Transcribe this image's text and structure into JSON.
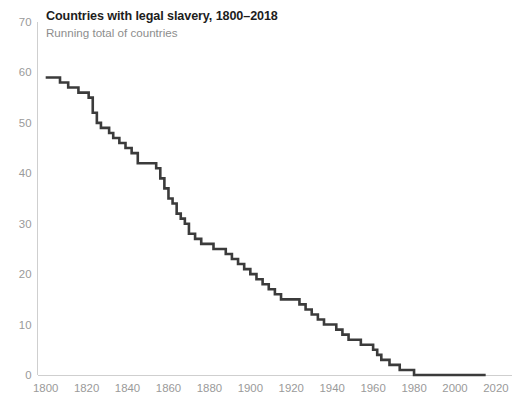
{
  "header": {
    "title": "Countries with legal slavery, 1800–2018",
    "subtitle": "Running total of countries"
  },
  "colors": {
    "line": "#3b3b3b",
    "axis": "#cfcfcf",
    "tick_label": "#9a9a9a",
    "title": "#1d1d1d",
    "subtitle": "#8d8d8d",
    "background": "#ffffff"
  },
  "chart_data": {
    "type": "line",
    "title": "Countries with legal slavery, 1800–2018",
    "subtitle": "Running total of countries",
    "xlabel": "",
    "ylabel": "",
    "xlim": [
      1796,
      2022
    ],
    "ylim": [
      0,
      70
    ],
    "grid": false,
    "legend": "none",
    "step": "post",
    "y_ticks": [
      0,
      10,
      20,
      30,
      40,
      50,
      60,
      70
    ],
    "x_ticks": [
      1800,
      1820,
      1840,
      1860,
      1880,
      1900,
      1920,
      1940,
      1960,
      1980,
      2000,
      2020
    ],
    "series": [
      {
        "name": "Countries with legal slavery",
        "x": [
          1800,
          1804,
          1807,
          1811,
          1813,
          1816,
          1819,
          1821,
          1823,
          1825,
          1827,
          1829,
          1831,
          1833,
          1836,
          1839,
          1842,
          1845,
          1848,
          1851,
          1854,
          1856,
          1858,
          1860,
          1862,
          1864,
          1866,
          1868,
          1870,
          1873,
          1876,
          1879,
          1882,
          1885,
          1888,
          1891,
          1894,
          1897,
          1900,
          1903,
          1906,
          1909,
          1912,
          1915,
          1918,
          1921,
          1924,
          1927,
          1930,
          1933,
          1936,
          1939,
          1942,
          1945,
          1948,
          1951,
          1954,
          1957,
          1960,
          1962,
          1964,
          1966,
          1968,
          1970,
          1973,
          1976,
          1980,
          1990,
          2000,
          2010,
          2015
        ],
        "y": [
          59,
          59,
          58,
          57,
          57,
          56,
          56,
          55,
          52,
          50,
          49,
          49,
          48,
          47,
          46,
          45,
          44,
          42,
          42,
          42,
          41,
          39,
          37,
          35,
          34,
          32,
          31,
          30,
          28,
          27,
          26,
          26,
          25,
          25,
          24,
          23,
          22,
          21,
          20,
          19,
          18,
          17,
          16,
          15,
          15,
          15,
          14,
          13,
          12,
          11,
          10,
          10,
          9,
          8,
          7,
          7,
          6,
          6,
          5,
          4,
          3,
          3,
          2,
          2,
          1,
          1,
          0,
          0,
          0,
          0,
          0
        ]
      }
    ]
  }
}
